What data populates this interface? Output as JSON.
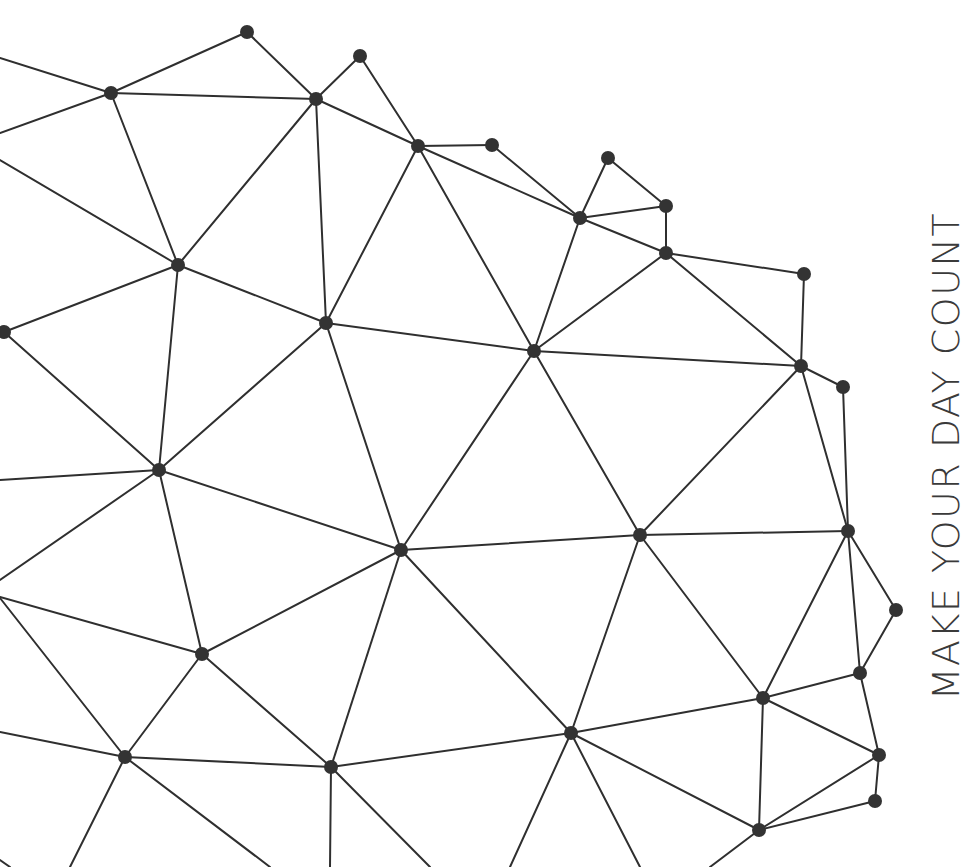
{
  "artwork": {
    "type": "low-poly network / constellation illustration",
    "colors": {
      "background": "#ffffff",
      "line": "#2f2f2f",
      "node": "#333333",
      "text": "#3a3a3a"
    },
    "tagline": "MAKE YOUR DAY COUNT",
    "nodes": [
      {
        "id": "a",
        "x": 247,
        "y": 32,
        "r": 7
      },
      {
        "id": "b",
        "x": 360,
        "y": 56,
        "r": 7
      },
      {
        "id": "c",
        "x": 111,
        "y": 93,
        "r": 7
      },
      {
        "id": "d",
        "x": 316,
        "y": 99,
        "r": 7
      },
      {
        "id": "e",
        "x": 418,
        "y": 146,
        "r": 7
      },
      {
        "id": "f",
        "x": 492,
        "y": 145,
        "r": 7
      },
      {
        "id": "g",
        "x": 608,
        "y": 158,
        "r": 7
      },
      {
        "id": "h",
        "x": 666,
        "y": 206,
        "r": 7
      },
      {
        "id": "i",
        "x": 580,
        "y": 218,
        "r": 7
      },
      {
        "id": "j",
        "x": 666,
        "y": 253,
        "r": 7
      },
      {
        "id": "k",
        "x": 178,
        "y": 265,
        "r": 7
      },
      {
        "id": "l",
        "x": 804,
        "y": 274,
        "r": 7
      },
      {
        "id": "m",
        "x": 326,
        "y": 323,
        "r": 7
      },
      {
        "id": "n",
        "x": 4,
        "y": 332,
        "r": 7
      },
      {
        "id": "o",
        "x": 534,
        "y": 351,
        "r": 7
      },
      {
        "id": "p",
        "x": 801,
        "y": 366,
        "r": 7
      },
      {
        "id": "q",
        "x": 843,
        "y": 387,
        "r": 7
      },
      {
        "id": "r",
        "x": 159,
        "y": 470,
        "r": 7
      },
      {
        "id": "s",
        "x": 848,
        "y": 531,
        "r": 7
      },
      {
        "id": "t",
        "x": 640,
        "y": 535,
        "r": 7
      },
      {
        "id": "u",
        "x": 401,
        "y": 550,
        "r": 7
      },
      {
        "id": "v",
        "x": 896,
        "y": 610,
        "r": 7
      },
      {
        "id": "w",
        "x": 202,
        "y": 654,
        "r": 7
      },
      {
        "id": "x",
        "x": 860,
        "y": 673,
        "r": 7
      },
      {
        "id": "y",
        "x": 763,
        "y": 698,
        "r": 7
      },
      {
        "id": "z",
        "x": 571,
        "y": 733,
        "r": 7
      },
      {
        "id": "aa",
        "x": 125,
        "y": 757,
        "r": 7
      },
      {
        "id": "ab",
        "x": 331,
        "y": 767,
        "r": 7
      },
      {
        "id": "ac",
        "x": 879,
        "y": 755,
        "r": 7
      },
      {
        "id": "ad",
        "x": 875,
        "y": 801,
        "r": 7
      },
      {
        "id": "ae",
        "x": 759,
        "y": 830,
        "r": 7
      }
    ],
    "edges": [
      [
        "a",
        "c"
      ],
      [
        "a",
        "d"
      ],
      [
        "b",
        "d"
      ],
      [
        "b",
        "e"
      ],
      [
        "c",
        "d"
      ],
      [
        "c",
        "k"
      ],
      [
        "d",
        "e"
      ],
      [
        "d",
        "k"
      ],
      [
        "d",
        "m"
      ],
      [
        "e",
        "f"
      ],
      [
        "e",
        "i"
      ],
      [
        "e",
        "m"
      ],
      [
        "e",
        "o"
      ],
      [
        "f",
        "i"
      ],
      [
        "g",
        "i"
      ],
      [
        "g",
        "h"
      ],
      [
        "h",
        "i"
      ],
      [
        "h",
        "j"
      ],
      [
        "i",
        "j"
      ],
      [
        "i",
        "o"
      ],
      [
        "j",
        "o"
      ],
      [
        "j",
        "l"
      ],
      [
        "j",
        "p"
      ],
      [
        "l",
        "p"
      ],
      [
        "p",
        "q"
      ],
      [
        "o",
        "p"
      ],
      [
        "o",
        "m"
      ],
      [
        "k",
        "m"
      ],
      [
        "k",
        "n"
      ],
      [
        "k",
        "r"
      ],
      [
        "m",
        "r"
      ],
      [
        "m",
        "u"
      ],
      [
        "o",
        "u"
      ],
      [
        "o",
        "t"
      ],
      [
        "p",
        "t"
      ],
      [
        "p",
        "s"
      ],
      [
        "q",
        "s"
      ],
      [
        "s",
        "t"
      ],
      [
        "s",
        "v"
      ],
      [
        "s",
        "x"
      ],
      [
        "s",
        "y"
      ],
      [
        "v",
        "x"
      ],
      [
        "x",
        "y"
      ],
      [
        "x",
        "ac"
      ],
      [
        "y",
        "ac"
      ],
      [
        "y",
        "t"
      ],
      [
        "y",
        "z"
      ],
      [
        "y",
        "ae"
      ],
      [
        "ac",
        "ad"
      ],
      [
        "ac",
        "ae"
      ],
      [
        "ad",
        "ae"
      ],
      [
        "t",
        "u"
      ],
      [
        "t",
        "z"
      ],
      [
        "u",
        "r"
      ],
      [
        "u",
        "w"
      ],
      [
        "u",
        "z"
      ],
      [
        "u",
        "ab"
      ],
      [
        "r",
        "w"
      ],
      [
        "n",
        "r"
      ],
      [
        "w",
        "aa"
      ],
      [
        "w",
        "ab"
      ],
      [
        "aa",
        "ab"
      ],
      [
        "z",
        "ab"
      ],
      [
        "z",
        "ae"
      ]
    ],
    "edge_stubs": [
      [
        0,
        58,
        111,
        93
      ],
      [
        0,
        133,
        111,
        93
      ],
      [
        0,
        160,
        178,
        265
      ],
      [
        0,
        480,
        159,
        470
      ],
      [
        0,
        580,
        159,
        470
      ],
      [
        0,
        597,
        202,
        654
      ],
      [
        0,
        598,
        125,
        757
      ],
      [
        0,
        732,
        125,
        757
      ],
      [
        125,
        757,
        70,
        867
      ],
      [
        125,
        757,
        270,
        867
      ],
      [
        331,
        767,
        330,
        867
      ],
      [
        331,
        767,
        430,
        867
      ],
      [
        571,
        733,
        510,
        867
      ],
      [
        571,
        733,
        640,
        867
      ],
      [
        759,
        830,
        710,
        867
      ],
      [
        0,
        860,
        10,
        867
      ]
    ]
  }
}
